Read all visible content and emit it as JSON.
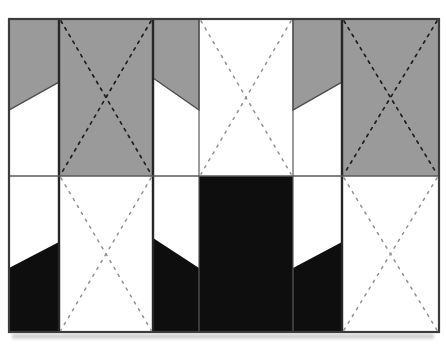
{
  "figure": {
    "canvas": {
      "width": 446,
      "height": 344
    },
    "frame": {
      "x": 9,
      "y": 19,
      "width": 430,
      "height": 313
    },
    "divider_y": 176,
    "column_x": [
      9,
      59,
      153,
      199,
      293,
      342,
      439
    ],
    "colors": {
      "gray": "#9a9a9a",
      "black": "#0e0e0e",
      "white": "#ffffff",
      "border": "#3c3c3c",
      "thick_line": "#262626",
      "thin_line": "#5a5a5a",
      "flap_edge": "#4a4a4a",
      "dash_on_gray": "#1f1f1f",
      "dash_on_white": "#909090",
      "shadow": "#bdbdbd"
    },
    "shapes": [
      {
        "id": "top-cell-1-gray-flap",
        "type": "polygon",
        "fill": "gray",
        "outline": true,
        "points": [
          [
            9,
            19
          ],
          [
            59,
            19
          ],
          [
            59,
            82
          ],
          [
            9,
            110
          ]
        ]
      },
      {
        "id": "top-cell-2-gray-panel",
        "type": "rect",
        "fill": "gray",
        "x1": 59,
        "y1": 19,
        "x2": 153,
        "y2": 176
      },
      {
        "id": "top-cell-3-gray-flap",
        "type": "polygon",
        "fill": "gray",
        "outline": true,
        "points": [
          [
            153,
            19
          ],
          [
            199,
            19
          ],
          [
            199,
            110
          ],
          [
            153,
            78
          ]
        ]
      },
      {
        "id": "top-cell-5-gray-flap",
        "type": "polygon",
        "fill": "gray",
        "outline": true,
        "points": [
          [
            293,
            19
          ],
          [
            342,
            19
          ],
          [
            342,
            82
          ],
          [
            293,
            110
          ]
        ]
      },
      {
        "id": "top-cell-6-gray-panel",
        "type": "rect",
        "fill": "gray",
        "x1": 342,
        "y1": 19,
        "x2": 439,
        "y2": 176
      },
      {
        "id": "bottom-cell-1-black-flap",
        "type": "polygon",
        "fill": "black",
        "outline": false,
        "points": [
          [
            9,
            268
          ],
          [
            59,
            242
          ],
          [
            59,
            332
          ],
          [
            9,
            332
          ]
        ]
      },
      {
        "id": "bottom-cell-3-black-flap",
        "type": "polygon",
        "fill": "black",
        "outline": false,
        "points": [
          [
            153,
            238
          ],
          [
            199,
            268
          ],
          [
            199,
            332
          ],
          [
            153,
            332
          ]
        ]
      },
      {
        "id": "bottom-cell-4-black-panel",
        "type": "rect",
        "fill": "black",
        "x1": 199,
        "y1": 176,
        "x2": 293,
        "y2": 332
      },
      {
        "id": "bottom-cell-5-black-flap",
        "type": "polygon",
        "fill": "black",
        "outline": false,
        "points": [
          [
            293,
            268
          ],
          [
            342,
            242
          ],
          [
            342,
            332
          ],
          [
            293,
            332
          ]
        ]
      }
    ],
    "fold_crosses": [
      {
        "id": "top-cell-2-fold-cross",
        "x1": 59,
        "y1": 19,
        "x2": 153,
        "y2": 176,
        "dash": "dark"
      },
      {
        "id": "top-cell-4-fold-cross",
        "x1": 199,
        "y1": 19,
        "x2": 293,
        "y2": 176,
        "dash": "light"
      },
      {
        "id": "top-cell-6-fold-cross",
        "x1": 342,
        "y1": 19,
        "x2": 439,
        "y2": 176,
        "dash": "dark"
      },
      {
        "id": "bottom-cell-2-fold-cross",
        "x1": 59,
        "y1": 176,
        "x2": 153,
        "y2": 332,
        "dash": "light"
      },
      {
        "id": "bottom-cell-6-fold-cross",
        "x1": 342,
        "y1": 176,
        "x2": 439,
        "y2": 332,
        "dash": "light"
      }
    ],
    "grid_lines": {
      "vertical": [
        {
          "x": 59,
          "weight": "thick"
        },
        {
          "x": 153,
          "weight": "thick"
        },
        {
          "x": 199,
          "weight": "thin"
        },
        {
          "x": 293,
          "weight": "thin"
        },
        {
          "x": 342,
          "weight": "thick"
        }
      ],
      "horizontal_divider": {
        "y": 176,
        "weight": "thin"
      }
    },
    "dash_styles": {
      "dark": {
        "width": 1.7,
        "array": "2.6 5.2"
      },
      "light": {
        "width": 1.5,
        "array": "2.2 5.8"
      }
    },
    "cross_corner_inset": 2
  }
}
